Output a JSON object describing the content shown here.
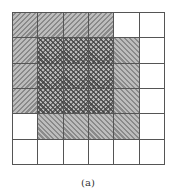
{
  "figure": {
    "caption": "(a)",
    "grid": {
      "rows": 6,
      "cols": 6,
      "legend_key": {
        "fwd": "diagonal hatch (/) — region A",
        "back": "diagonal hatch (\\) — region B",
        "cross": "crosshatch — overlap of A and B",
        "empty": "white cell"
      },
      "cells": [
        [
          "fwd",
          "fwd",
          "fwd",
          "fwd",
          "empty",
          "empty"
        ],
        [
          "fwd",
          "cross",
          "cross",
          "cross",
          "back",
          "empty"
        ],
        [
          "fwd",
          "cross",
          "cross",
          "cross",
          "back",
          "empty"
        ],
        [
          "fwd",
          "cross",
          "cross",
          "cross",
          "back",
          "empty"
        ],
        [
          "empty",
          "back",
          "back",
          "back",
          "back",
          "empty"
        ],
        [
          "empty",
          "empty",
          "empty",
          "empty",
          "empty",
          "empty"
        ]
      ]
    },
    "colors": {
      "grid_line": "#555555",
      "hatch_dark": "#8a8a8a",
      "hatch_light": "#bdbdbd",
      "background": "#ffffff"
    }
  }
}
